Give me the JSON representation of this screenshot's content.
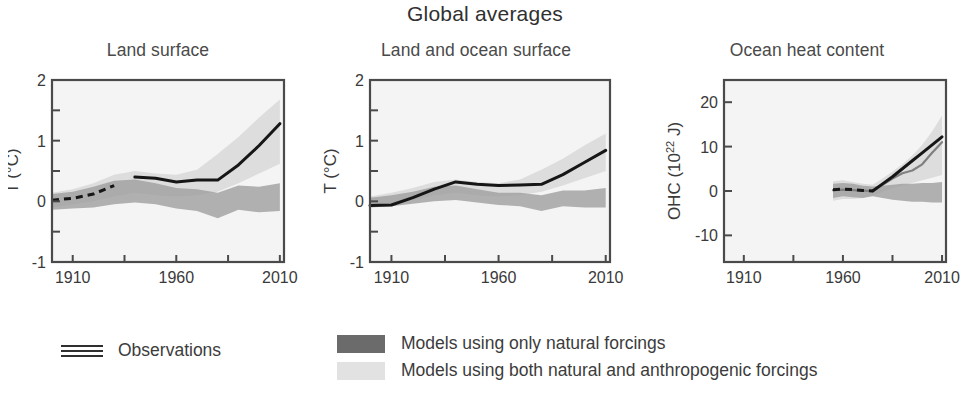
{
  "figure": {
    "title": "Global averages",
    "width": 970,
    "height": 406
  },
  "colors": {
    "natural_band": "#9a9a9a",
    "natural_band_legend": "#6b6b6b",
    "anthropogenic_band": "#d8d8d8",
    "anthropogenic_band_legend": "#e2e2e2",
    "observation_line": "#161616",
    "model_median_line": "#808080",
    "axis": "#4a4a4a",
    "panel_background": "#f4f4f4",
    "text": "#3a3a3a"
  },
  "legend": {
    "observations": {
      "label": "Observations",
      "icon": "three-horizontal-lines"
    },
    "models": [
      {
        "label": "Models using only natural forcings",
        "swatch": "#6b6b6b"
      },
      {
        "label": "Models using both natural and anthropogenic forcings",
        "swatch": "#e2e2e2"
      }
    ]
  },
  "chart_data": [
    {
      "type": "line",
      "title": "Land surface",
      "xlabel": "",
      "ylabel": "T (°C)",
      "xlim": [
        1900,
        2012
      ],
      "ylim": [
        -1,
        2
      ],
      "xticks": [
        1910,
        1935,
        1960,
        1985,
        2010
      ],
      "xticklabels": [
        "1910",
        "",
        "1960",
        "",
        "2010"
      ],
      "yticks": [
        -1,
        -0.5,
        0,
        0.5,
        1,
        1.5,
        2
      ],
      "yticklabels": [
        "-1",
        "",
        "0",
        "",
        "1",
        "",
        "2"
      ],
      "grid": false,
      "legend_position": "below-figure",
      "x": [
        1900,
        1910,
        1920,
        1930,
        1940,
        1950,
        1960,
        1970,
        1980,
        1990,
        2000,
        2010
      ],
      "series": [
        {
          "name": "Observations",
          "style": "dashed-then-solid",
          "dashed_until": 1935,
          "values": [
            0.02,
            0.05,
            0.12,
            0.26,
            0.4,
            0.38,
            0.32,
            0.35,
            0.35,
            0.6,
            0.92,
            1.28
          ]
        },
        {
          "name": "Models using only natural forcings",
          "style": "band",
          "lower": [
            -0.14,
            -0.12,
            -0.1,
            -0.05,
            -0.02,
            -0.05,
            -0.12,
            -0.16,
            -0.28,
            -0.14,
            -0.18,
            -0.16
          ],
          "upper": [
            0.12,
            0.16,
            0.24,
            0.34,
            0.36,
            0.3,
            0.22,
            0.2,
            0.14,
            0.26,
            0.24,
            0.3
          ]
        },
        {
          "name": "Models using both natural and anthropogenic forcings",
          "style": "band",
          "lower": [
            -0.1,
            -0.05,
            0.0,
            0.08,
            0.14,
            0.1,
            0.08,
            0.1,
            0.16,
            0.3,
            0.46,
            0.62
          ],
          "upper": [
            0.14,
            0.2,
            0.3,
            0.44,
            0.5,
            0.46,
            0.44,
            0.52,
            0.78,
            1.06,
            1.38,
            1.68
          ]
        }
      ]
    },
    {
      "type": "line",
      "title": "Land and ocean surface",
      "xlabel": "",
      "ylabel": "T (°C)",
      "xlim": [
        1900,
        2012
      ],
      "ylim": [
        -1,
        2
      ],
      "xticks": [
        1910,
        1935,
        1960,
        1985,
        2010
      ],
      "xticklabels": [
        "1910",
        "",
        "1960",
        "",
        "2010"
      ],
      "yticks": [
        -1,
        -0.5,
        0,
        0.5,
        1,
        1.5,
        2
      ],
      "yticklabels": [
        "-1",
        "",
        "0",
        "",
        "1",
        "",
        "2"
      ],
      "grid": false,
      "legend_position": "below-figure",
      "x": [
        1900,
        1910,
        1920,
        1930,
        1940,
        1950,
        1960,
        1970,
        1980,
        1990,
        2000,
        2010
      ],
      "series": [
        {
          "name": "Observations",
          "style": "solid",
          "values": [
            -0.07,
            -0.06,
            0.06,
            0.2,
            0.32,
            0.28,
            0.26,
            0.27,
            0.28,
            0.44,
            0.64,
            0.84
          ]
        },
        {
          "name": "Models using only natural forcings",
          "style": "band",
          "lower": [
            -0.1,
            -0.08,
            -0.04,
            0.0,
            0.02,
            -0.02,
            -0.06,
            -0.08,
            -0.16,
            -0.08,
            -0.1,
            -0.1
          ],
          "upper": [
            0.06,
            0.1,
            0.16,
            0.24,
            0.26,
            0.2,
            0.14,
            0.14,
            0.1,
            0.18,
            0.18,
            0.22
          ]
        },
        {
          "name": "Models using both natural and anthropogenic forcings",
          "style": "band",
          "lower": [
            -0.08,
            -0.04,
            0.02,
            0.1,
            0.14,
            0.1,
            0.08,
            0.1,
            0.16,
            0.26,
            0.38,
            0.5
          ],
          "upper": [
            0.08,
            0.14,
            0.22,
            0.32,
            0.36,
            0.32,
            0.3,
            0.36,
            0.52,
            0.7,
            0.92,
            1.12
          ]
        }
      ]
    },
    {
      "type": "line",
      "title": "Ocean heat content",
      "xlabel": "",
      "ylabel": "OHC (10²² J)",
      "ylabel_base": "OHC (10",
      "ylabel_exponent": "22",
      "ylabel_tail": " J)",
      "xlim": [
        1900,
        2012
      ],
      "ylim": [
        -16,
        25
      ],
      "xticks": [
        1910,
        1935,
        1960,
        1985,
        2010
      ],
      "xticklabels": [
        "1910",
        "",
        "1960",
        "",
        "2010"
      ],
      "yticks": [
        -10,
        0,
        10,
        20
      ],
      "yticklabels": [
        "-10",
        "0",
        "10",
        "20"
      ],
      "grid": false,
      "legend_position": "below-figure",
      "data_start_year": 1955,
      "x": [
        1955,
        1960,
        1965,
        1970,
        1975,
        1980,
        1985,
        1990,
        1995,
        2000,
        2005,
        2010
      ],
      "series": [
        {
          "name": "Observations",
          "style": "dashed-then-solid",
          "dashed_until": 1975,
          "values": [
            0.3,
            0.4,
            0.3,
            0.1,
            0.0,
            1.6,
            3.2,
            5.0,
            6.8,
            8.6,
            10.4,
            12.2
          ]
        },
        {
          "name": "Model median (natural and anthropogenic)",
          "style": "line",
          "values": [
            0.2,
            0.3,
            0.2,
            0.1,
            0.0,
            1.4,
            2.8,
            4.0,
            4.6,
            6.0,
            8.6,
            11.0
          ]
        },
        {
          "name": "Models using only natural forcings",
          "style": "band",
          "lower": [
            -1.6,
            -1.2,
            -1.4,
            -1.6,
            -1.2,
            -1.6,
            -2.0,
            -2.2,
            -2.4,
            -2.4,
            -2.6,
            -2.6
          ],
          "upper": [
            1.6,
            1.8,
            1.6,
            1.2,
            1.0,
            1.2,
            1.4,
            1.6,
            1.6,
            1.8,
            1.8,
            2.0
          ]
        },
        {
          "name": "Models using both natural and anthropogenic forcings",
          "style": "band",
          "lower": [
            -2.2,
            -1.8,
            -1.8,
            -1.6,
            -1.0,
            -0.2,
            0.6,
            1.2,
            1.8,
            2.4,
            3.0,
            3.6
          ],
          "upper": [
            2.2,
            2.4,
            2.0,
            1.6,
            1.4,
            2.8,
            4.4,
            6.0,
            8.0,
            10.4,
            13.4,
            17.0
          ]
        }
      ]
    }
  ]
}
